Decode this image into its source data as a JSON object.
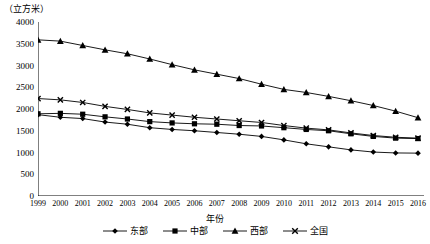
{
  "chart_data": {
    "type": "line",
    "title": "",
    "unit_label": "（立方米）",
    "xlabel": "年份",
    "ylabel": "",
    "ylim": [
      0,
      4000
    ],
    "ytick_step": 500,
    "yticks": [
      0,
      500,
      1000,
      1500,
      2000,
      2500,
      3000,
      3500,
      4000
    ],
    "grid": false,
    "legend_position": "bottom",
    "categories": [
      "1999",
      "2000",
      "2001",
      "2002",
      "2003",
      "2004",
      "2005",
      "2006",
      "2007",
      "2008",
      "2009",
      "2010",
      "2011",
      "2012",
      "2013",
      "2014",
      "2015",
      "2016"
    ],
    "series": [
      {
        "name": "东部",
        "marker": "diamond",
        "values": [
          1870,
          1810,
          1780,
          1700,
          1650,
          1570,
          1530,
          1500,
          1460,
          1420,
          1370,
          1290,
          1200,
          1130,
          1060,
          1010,
          990,
          985
        ]
      },
      {
        "name": "中部",
        "marker": "square",
        "values": [
          1890,
          1900,
          1880,
          1820,
          1770,
          1710,
          1680,
          1660,
          1650,
          1620,
          1610,
          1570,
          1530,
          1500,
          1430,
          1370,
          1330,
          1320
        ]
      },
      {
        "name": "西部",
        "marker": "triangle",
        "values": [
          3590,
          3560,
          3460,
          3360,
          3270,
          3150,
          3020,
          2900,
          2800,
          2700,
          2570,
          2450,
          2380,
          2290,
          2190,
          2080,
          1950,
          1800
        ]
      },
      {
        "name": "全国",
        "marker": "cross",
        "values": [
          2240,
          2210,
          2150,
          2060,
          1990,
          1910,
          1860,
          1810,
          1770,
          1730,
          1690,
          1620,
          1560,
          1520,
          1450,
          1390,
          1350,
          1330
        ]
      }
    ]
  },
  "legend": {
    "items": [
      {
        "label": "东部",
        "marker": "diamond"
      },
      {
        "label": "中部",
        "marker": "square"
      },
      {
        "label": "西部",
        "marker": "triangle"
      },
      {
        "label": "全国",
        "marker": "cross"
      }
    ]
  }
}
